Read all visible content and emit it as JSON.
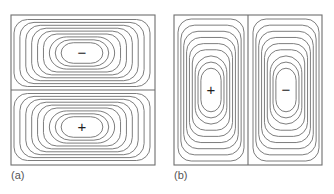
{
  "figure": {
    "panels": [
      {
        "id": "a",
        "label": "(a)",
        "box": {
          "x": 11,
          "y": 15,
          "w": 144,
          "h": 150
        },
        "divider": "horizontal",
        "cells": [
          {
            "sign": "−",
            "cx": 82,
            "cy": 53
          },
          {
            "sign": "+",
            "cx": 82,
            "cy": 127
          }
        ]
      },
      {
        "id": "b",
        "label": "(b)",
        "box": {
          "x": 174,
          "y": 15,
          "w": 148,
          "h": 150
        },
        "divider": "vertical",
        "cells": [
          {
            "sign": "+",
            "cx": 211,
            "cy": 90
          },
          {
            "sign": "−",
            "cx": 286,
            "cy": 90
          }
        ]
      }
    ],
    "contours_per_cell": 9,
    "line_color": "#6e6e6e",
    "sign_color": "#222222"
  }
}
